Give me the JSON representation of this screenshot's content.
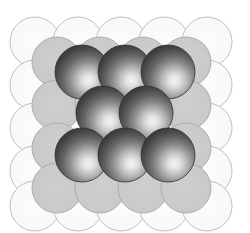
{
  "figure": {
    "width": 250,
    "height": 233,
    "background_color": "#ffffff"
  },
  "colors": {
    "background": "#ffffff",
    "bottom_layer_fill": "#fbfbfa",
    "bottom_layer_stroke": "#b9b9b5",
    "middle_layer_fill": "#c9c9c7",
    "middle_layer_stroke": "#a8a8a4",
    "top_layer_dark": "#3b3b3b",
    "top_layer_mid": "#6e6e6e",
    "top_layer_highlight": "#f2f2f2",
    "top_layer_stroke": "#2f2f2f"
  },
  "geometry": {
    "sphere_radius": 25,
    "bottom_radius": 25,
    "middle_radius": 25,
    "top_radius": 27
  },
  "layers": [
    {
      "name": "bottom-layer",
      "label": "Bottom layer (A) - outlined open circles",
      "style": "outline",
      "radius": 25,
      "circles": [
        {
          "cx": 35,
          "cy": 42
        },
        {
          "cx": 78,
          "cy": 42
        },
        {
          "cx": 121,
          "cy": 42
        },
        {
          "cx": 164,
          "cy": 42
        },
        {
          "cx": 207,
          "cy": 42
        },
        {
          "cx": 35,
          "cy": 85
        },
        {
          "cx": 78,
          "cy": 85
        },
        {
          "cx": 121,
          "cy": 85
        },
        {
          "cx": 164,
          "cy": 85
        },
        {
          "cx": 207,
          "cy": 85
        },
        {
          "cx": 35,
          "cy": 128
        },
        {
          "cx": 78,
          "cy": 128
        },
        {
          "cx": 121,
          "cy": 128
        },
        {
          "cx": 164,
          "cy": 128
        },
        {
          "cx": 207,
          "cy": 128
        },
        {
          "cx": 35,
          "cy": 171
        },
        {
          "cx": 78,
          "cy": 171
        },
        {
          "cx": 121,
          "cy": 171
        },
        {
          "cx": 164,
          "cy": 171
        },
        {
          "cx": 207,
          "cy": 171
        },
        {
          "cx": 35,
          "cy": 206
        },
        {
          "cx": 78,
          "cy": 206
        },
        {
          "cx": 121,
          "cy": 206
        },
        {
          "cx": 164,
          "cy": 206
        },
        {
          "cx": 207,
          "cy": 206
        }
      ]
    },
    {
      "name": "middle-layer",
      "label": "Middle layer (B) - medium gray circles",
      "style": "flat-gray",
      "radius": 25,
      "circles": [
        {
          "cx": 57,
          "cy": 62
        },
        {
          "cx": 100,
          "cy": 62
        },
        {
          "cx": 143,
          "cy": 62
        },
        {
          "cx": 186,
          "cy": 62
        },
        {
          "cx": 57,
          "cy": 105
        },
        {
          "cx": 100,
          "cy": 105
        },
        {
          "cx": 143,
          "cy": 105
        },
        {
          "cx": 186,
          "cy": 105
        },
        {
          "cx": 57,
          "cy": 148
        },
        {
          "cx": 100,
          "cy": 148
        },
        {
          "cx": 143,
          "cy": 148
        },
        {
          "cx": 186,
          "cy": 148
        },
        {
          "cx": 57,
          "cy": 188
        },
        {
          "cx": 100,
          "cy": 188
        },
        {
          "cx": 143,
          "cy": 188
        },
        {
          "cx": 186,
          "cy": 188
        }
      ]
    },
    {
      "name": "top-layer",
      "label": "Top layer (C) - shaded dark spheres",
      "style": "shaded-sphere",
      "radius": 27,
      "circles": [
        {
          "cx": 82,
          "cy": 72
        },
        {
          "cx": 125,
          "cy": 72
        },
        {
          "cx": 168,
          "cy": 72
        },
        {
          "cx": 103,
          "cy": 113
        },
        {
          "cx": 146,
          "cy": 113
        },
        {
          "cx": 82,
          "cy": 155
        },
        {
          "cx": 125,
          "cy": 155
        },
        {
          "cx": 168,
          "cy": 155
        }
      ]
    }
  ]
}
